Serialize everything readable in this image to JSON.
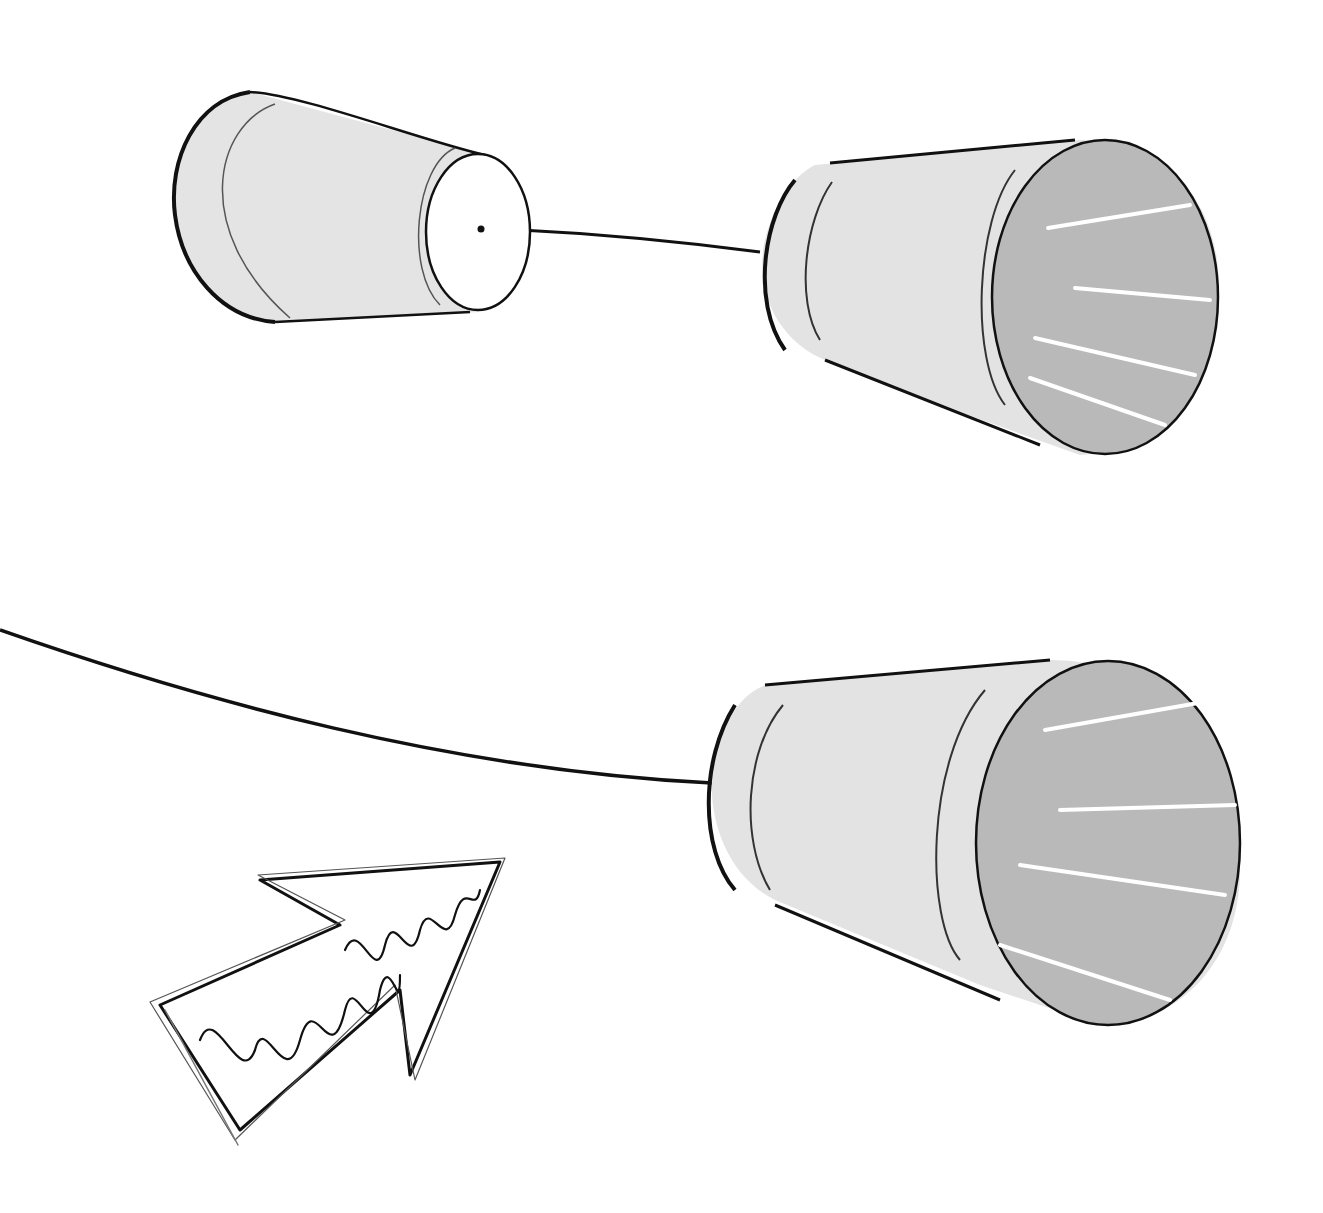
{
  "scene": {
    "description": "Cup-and-string telephone illustration with a sketched arrow",
    "background": "#ffffff",
    "colors": {
      "cup_body": "#e3e3e3",
      "cup_interior": "#b8b8b8",
      "cup_bottom": "#ffffff",
      "outline": "#111111",
      "highlight": "#ffffff",
      "string": "#111111"
    },
    "objects": [
      {
        "id": "cup-small-back",
        "label": "Cup seen from bottom with string attached"
      },
      {
        "id": "cup-top-right",
        "label": "Cup seen from opening"
      },
      {
        "id": "string-top",
        "label": "String connecting the two upper cups"
      },
      {
        "id": "cup-bottom-right",
        "label": "Cup seen from opening, lower"
      },
      {
        "id": "string-bottom",
        "label": "String running off left edge to lower cup"
      },
      {
        "id": "sketch-arrow",
        "label": "Hand-drawn scribbled arrow pointing up-right"
      }
    ]
  }
}
